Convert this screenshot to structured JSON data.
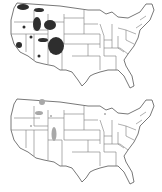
{
  "figure": {
    "panels": [
      {
        "id": "top",
        "description": "US map with dark shaded regions in western states",
        "shade_color": "#2e2e2e",
        "regions": [
          {
            "name": "northern-idaho-montana-1",
            "cx": 23,
            "cy": 7,
            "rx": 6,
            "ry": 3
          },
          {
            "name": "northern-montana-2",
            "cx": 39,
            "cy": 10,
            "rx": 5,
            "ry": 2
          },
          {
            "name": "idaho-central",
            "cx": 37,
            "cy": 24,
            "rx": 4,
            "ry": 7
          },
          {
            "name": "wyoming-nw",
            "cx": 50,
            "cy": 25,
            "rx": 6,
            "ry": 5
          },
          {
            "name": "oregon-dot",
            "cx": 24,
            "cy": 27,
            "rx": 1.5,
            "ry": 1.5
          },
          {
            "name": "nevada-dot",
            "cx": 31,
            "cy": 37,
            "rx": 1.5,
            "ry": 1.5
          },
          {
            "name": "utah-belt",
            "cx": 43,
            "cy": 40,
            "rx": 5,
            "ry": 2
          },
          {
            "name": "colorado-large",
            "cx": 56,
            "cy": 46,
            "rx": 8,
            "ry": 9
          },
          {
            "name": "california-sierra",
            "cx": 19,
            "cy": 45,
            "rx": 3,
            "ry": 3
          },
          {
            "name": "arizona-dot",
            "cx": 39,
            "cy": 56,
            "rx": 1.5,
            "ry": 1.5
          }
        ]
      },
      {
        "id": "bottom",
        "description": "US map with light gray shaded regions",
        "shade_color": "#a8a8a8",
        "regions": [
          {
            "name": "montana-west",
            "cx": 42,
            "cy": 6,
            "rx": 3,
            "ry": 3
          },
          {
            "name": "idaho-wyoming",
            "cx": 39,
            "cy": 17,
            "rx": 4,
            "ry": 2
          },
          {
            "name": "wyoming-dots",
            "cx": 51,
            "cy": 20,
            "rx": 1,
            "ry": 1
          },
          {
            "name": "colorado-strip",
            "cx": 54,
            "cy": 38,
            "rx": 2.5,
            "ry": 7
          },
          {
            "name": "nevada-dot",
            "cx": 31,
            "cy": 30,
            "rx": 1,
            "ry": 1
          },
          {
            "name": "michigan-dot",
            "cx": 105,
            "cy": 18,
            "rx": 1,
            "ry": 1
          }
        ]
      }
    ]
  }
}
